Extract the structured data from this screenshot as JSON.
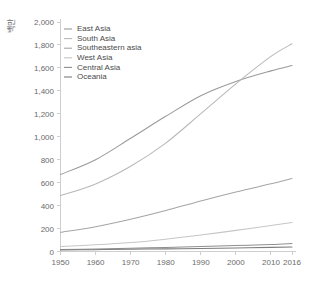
{
  "chart_data": {
    "type": "line",
    "title": "",
    "xlabel": "",
    "ylabel": "백만",
    "xlim": [
      1950,
      2016
    ],
    "ylim": [
      0,
      2000
    ],
    "grid": false,
    "legend_position": "top-left",
    "x": [
      1950,
      1960,
      1970,
      1980,
      1990,
      2000,
      2010,
      2016
    ],
    "xtick_labels": [
      "1950",
      "1960",
      "1970",
      "1980",
      "1990",
      "2000",
      "2010",
      "2016"
    ],
    "ytick_labels": [
      "0",
      "200",
      "400",
      "600",
      "800",
      "1,000",
      "1,200",
      "1,400",
      "1,600",
      "1,800",
      "2,000"
    ],
    "ytick_values": [
      0,
      200,
      400,
      600,
      800,
      1000,
      1200,
      1400,
      1600,
      1800,
      2000
    ],
    "series": [
      {
        "name": "East Asia",
        "color": "#9a9a9a",
        "values": [
          671,
          800,
          987,
          1178,
          1358,
          1482,
          1574,
          1620
        ]
      },
      {
        "name": "South Asia",
        "color": "#b8b8b8",
        "values": [
          486,
          589,
          743,
          945,
          1201,
          1461,
          1700,
          1810
        ]
      },
      {
        "name": "Southeastern asia",
        "color": "#a5a5a5",
        "values": [
          167,
          216,
          281,
          357,
          441,
          519,
          590,
          636
        ]
      },
      {
        "name": "West Asia",
        "color": "#c6c6c6",
        "values": [
          43,
          58,
          78,
          107,
          143,
          184,
          226,
          252
        ]
      },
      {
        "name": "Central Asia",
        "color": "#8f8f8f",
        "values": [
          17,
          22,
          28,
          35,
          43,
          52,
          61,
          70
        ]
      },
      {
        "name": "Oceania",
        "color": "#7d7d7d",
        "values": [
          13,
          16,
          19,
          23,
          26,
          31,
          36,
          40
        ]
      }
    ]
  },
  "legend": {
    "entries": [
      {
        "label": "East Asia"
      },
      {
        "label": "South Asia"
      },
      {
        "label": "Southeastern asia"
      },
      {
        "label": "West Asia"
      },
      {
        "label": "Central Asia"
      },
      {
        "label": "Oceania"
      }
    ]
  },
  "axes": {
    "y_axis_title": "백만"
  }
}
